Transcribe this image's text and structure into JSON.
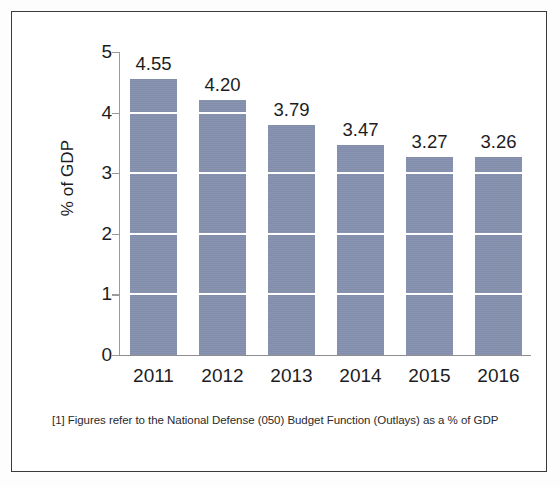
{
  "chart_data": {
    "type": "bar",
    "title": "",
    "subtitle": "",
    "xlabel": "",
    "ylabel": "% of GDP",
    "categories": [
      "2011",
      "2012",
      "2013",
      "2014",
      "2015",
      "2016"
    ],
    "values": [
      4.55,
      4.2,
      3.79,
      3.47,
      3.27,
      3.26
    ],
    "value_labels": [
      "4.55",
      "4.20",
      "3.79",
      "3.47",
      "3.27",
      "3.26"
    ],
    "ylim": [
      0,
      5
    ],
    "yticks": [
      0,
      1,
      2,
      3,
      4,
      5
    ],
    "ytick_labels": [
      "0",
      "1",
      "2",
      "3",
      "4",
      "5"
    ],
    "grid": "horizontal-white-over-bars",
    "legend": "none",
    "series": [
      {
        "name": "National Defense (050) Budget Function Outlays",
        "values": [
          4.55,
          4.2,
          3.79,
          3.47,
          3.27,
          3.26
        ],
        "color": "#8490ad"
      }
    ],
    "annotations": [
      "[1] Figures refer to the National Defense (050) Budget Function (Outlays) as a % of GDP"
    ]
  },
  "figure": {
    "footnote": "[1] Figures refer to the National Defense (050) Budget Function (Outlays) as a % of GDP",
    "axis_title_y": "% of GDP"
  },
  "colors": {
    "bar": "#8490ad",
    "gridline": "#ffffff",
    "axis": "#9a9a9c",
    "frame": "#3a3a3c",
    "text": "#1d1d1f",
    "background": "#ffffff"
  }
}
